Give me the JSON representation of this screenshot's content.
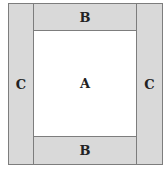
{
  "diagram": {
    "regions": {
      "center": {
        "label": "A"
      },
      "top": {
        "label": "B"
      },
      "bottom": {
        "label": "B"
      },
      "left": {
        "label": "C"
      },
      "right": {
        "label": "C"
      }
    },
    "colors": {
      "shaded": "#d9d9d9",
      "center": "#ffffff",
      "border": "#7d7d7d"
    }
  }
}
